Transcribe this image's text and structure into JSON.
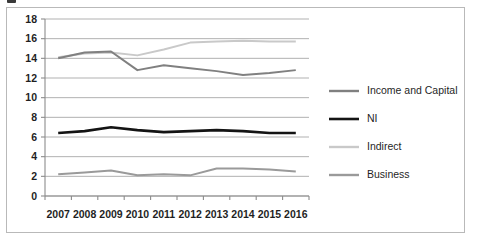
{
  "chart_data": {
    "type": "line",
    "title": "",
    "xlabel": "",
    "ylabel": "",
    "categories": [
      "2007",
      "2008",
      "2009",
      "2010",
      "2011",
      "2012",
      "2013",
      "2014",
      "2015",
      "2016"
    ],
    "ylim": [
      0,
      18
    ],
    "y_ticks": [
      0,
      2,
      4,
      6,
      8,
      10,
      12,
      14,
      16,
      18
    ],
    "y_tick_labels": [
      "0",
      "2",
      "4",
      "6",
      "8",
      "10",
      "12",
      "14",
      "16",
      "18"
    ],
    "grid": true,
    "grid_axis": "y",
    "legend_position": "right",
    "series": [
      {
        "name": "Income and Capital",
        "color": "#808080",
        "width": 2.0,
        "values": [
          14.0,
          14.6,
          14.7,
          12.8,
          13.3,
          13.0,
          12.7,
          12.3,
          12.5,
          12.8
        ]
      },
      {
        "name": "NI",
        "color": "#141414",
        "width": 2.6,
        "values": [
          6.4,
          6.6,
          7.0,
          6.7,
          6.5,
          6.6,
          6.7,
          6.6,
          6.4,
          6.4
        ]
      },
      {
        "name": "Indirect",
        "color": "#c9c9c9",
        "width": 2.0,
        "values": [
          14.1,
          14.5,
          14.6,
          14.3,
          14.9,
          15.6,
          15.7,
          15.8,
          15.7,
          15.7
        ]
      },
      {
        "name": "Business",
        "color": "#9a9a9a",
        "width": 2.0,
        "values": [
          2.2,
          2.4,
          2.6,
          2.1,
          2.2,
          2.1,
          2.8,
          2.8,
          2.7,
          2.5
        ]
      }
    ]
  },
  "style": {
    "grid_color": "#a8a8a8",
    "axis_color": "#8c8c8c",
    "frame_border_color": "#b9b9b9",
    "text_color": "#1f1f1f",
    "background": "#ffffff"
  }
}
